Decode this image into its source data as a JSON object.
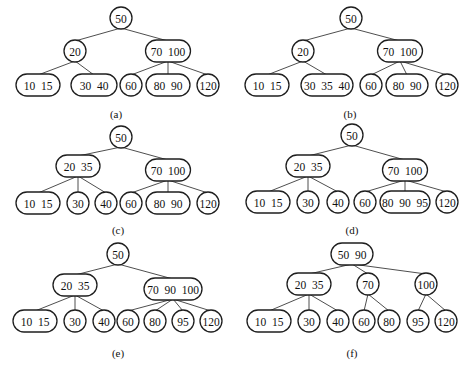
{
  "figure": {
    "panels": [
      {
        "id": "a",
        "caption": "(a)",
        "caption_pos": [
          116,
          114
        ],
        "nodes": [
          {
            "id": "root",
            "label": "50",
            "x": 121,
            "y": 18,
            "w": 22
          },
          {
            "id": "n20",
            "label": "20",
            "x": 75,
            "y": 51,
            "w": 22
          },
          {
            "id": "n70_100",
            "label": "70  100",
            "x": 168,
            "y": 51,
            "w": 45
          },
          {
            "id": "n10_15",
            "label": "10  15",
            "x": 38,
            "y": 85,
            "w": 44
          },
          {
            "id": "n30_40",
            "label": "30  40",
            "x": 94,
            "y": 85,
            "w": 46
          },
          {
            "id": "n60",
            "label": "60",
            "x": 131,
            "y": 85,
            "w": 22
          },
          {
            "id": "n80_90",
            "label": "80  90",
            "x": 168,
            "y": 85,
            "w": 44
          },
          {
            "id": "n120",
            "label": "120",
            "x": 208,
            "y": 85,
            "w": 22
          }
        ],
        "edges": [
          [
            "root",
            "n20"
          ],
          [
            "root",
            "n70_100"
          ],
          [
            "n20",
            "n10_15"
          ],
          [
            "n20",
            "n30_40"
          ],
          [
            "n70_100",
            "n60"
          ],
          [
            "n70_100",
            "n80_90"
          ],
          [
            "n70_100",
            "n120"
          ]
        ]
      },
      {
        "id": "b",
        "caption": "(b)",
        "caption_pos": [
          350,
          114
        ],
        "nodes": [
          {
            "id": "root",
            "label": "50",
            "x": 351,
            "y": 18,
            "w": 22
          },
          {
            "id": "n20",
            "label": "20",
            "x": 303,
            "y": 51,
            "w": 22
          },
          {
            "id": "n70_100",
            "label": "70  100",
            "x": 400,
            "y": 51,
            "w": 45
          },
          {
            "id": "n10_15",
            "label": "10  15",
            "x": 267,
            "y": 85,
            "w": 44
          },
          {
            "id": "n30_35_40",
            "label": "30  35  40",
            "x": 327,
            "y": 85,
            "w": 52
          },
          {
            "id": "n60",
            "label": "60",
            "x": 371,
            "y": 85,
            "w": 22
          },
          {
            "id": "n80_90",
            "label": "80  90",
            "x": 407,
            "y": 85,
            "w": 42
          },
          {
            "id": "n120",
            "label": "120",
            "x": 447,
            "y": 85,
            "w": 22
          }
        ],
        "edges": [
          [
            "root",
            "n20"
          ],
          [
            "root",
            "n70_100"
          ],
          [
            "n20",
            "n10_15"
          ],
          [
            "n20",
            "n30_35_40"
          ],
          [
            "n70_100",
            "n60"
          ],
          [
            "n70_100",
            "n80_90"
          ],
          [
            "n70_100",
            "n120"
          ]
        ]
      },
      {
        "id": "c",
        "caption": "(c)",
        "caption_pos": [
          118,
          230
        ],
        "nodes": [
          {
            "id": "root",
            "label": "50",
            "x": 121,
            "y": 137,
            "w": 22
          },
          {
            "id": "n20_35",
            "label": "20  35",
            "x": 78,
            "y": 166,
            "w": 44
          },
          {
            "id": "n70_100",
            "label": "70  100",
            "x": 168,
            "y": 170,
            "w": 45
          },
          {
            "id": "n10_15",
            "label": "10  15",
            "x": 38,
            "y": 203,
            "w": 44
          },
          {
            "id": "n30",
            "label": "30",
            "x": 78,
            "y": 203,
            "w": 22
          },
          {
            "id": "n40",
            "label": "40",
            "x": 106,
            "y": 203,
            "w": 22
          },
          {
            "id": "n60",
            "label": "60",
            "x": 131,
            "y": 203,
            "w": 22
          },
          {
            "id": "n80_90",
            "label": "80  90",
            "x": 168,
            "y": 203,
            "w": 44
          },
          {
            "id": "n120",
            "label": "120",
            "x": 208,
            "y": 203,
            "w": 22
          }
        ],
        "edges": [
          [
            "root",
            "n20_35"
          ],
          [
            "root",
            "n70_100"
          ],
          [
            "n20_35",
            "n10_15"
          ],
          [
            "n20_35",
            "n30"
          ],
          [
            "n20_35",
            "n40"
          ],
          [
            "n70_100",
            "n60"
          ],
          [
            "n70_100",
            "n80_90"
          ],
          [
            "n70_100",
            "n120"
          ]
        ]
      },
      {
        "id": "d",
        "caption": "(d)",
        "caption_pos": [
          352,
          230
        ],
        "nodes": [
          {
            "id": "root",
            "label": "50",
            "x": 352,
            "y": 135,
            "w": 22
          },
          {
            "id": "n20_35",
            "label": "20  35",
            "x": 308,
            "y": 166,
            "w": 44
          },
          {
            "id": "n70_100",
            "label": "70  100",
            "x": 405,
            "y": 170,
            "w": 45
          },
          {
            "id": "n10_15",
            "label": "10  15",
            "x": 268,
            "y": 202,
            "w": 44
          },
          {
            "id": "n30",
            "label": "30",
            "x": 308,
            "y": 202,
            "w": 22
          },
          {
            "id": "n40",
            "label": "40",
            "x": 338,
            "y": 202,
            "w": 22
          },
          {
            "id": "n60",
            "label": "60",
            "x": 365,
            "y": 202,
            "w": 22
          },
          {
            "id": "n80_90_95",
            "label": "80  90  95",
            "x": 405,
            "y": 202,
            "w": 50
          },
          {
            "id": "n120",
            "label": "120",
            "x": 447,
            "y": 202,
            "w": 22
          }
        ],
        "edges": [
          [
            "root",
            "n20_35"
          ],
          [
            "root",
            "n70_100"
          ],
          [
            "n20_35",
            "n10_15"
          ],
          [
            "n20_35",
            "n30"
          ],
          [
            "n20_35",
            "n40"
          ],
          [
            "n70_100",
            "n60"
          ],
          [
            "n70_100",
            "n80_90_95"
          ],
          [
            "n70_100",
            "n120"
          ]
        ]
      },
      {
        "id": "e",
        "caption": "(e)",
        "caption_pos": [
          118,
          353
        ],
        "nodes": [
          {
            "id": "root",
            "label": "50",
            "x": 118,
            "y": 254,
            "w": 22
          },
          {
            "id": "n20_35",
            "label": "20  35",
            "x": 75,
            "y": 285,
            "w": 44
          },
          {
            "id": "n70_90_100",
            "label": "70  90  100",
            "x": 173,
            "y": 289,
            "w": 58
          },
          {
            "id": "n10_15",
            "label": "10  15",
            "x": 35,
            "y": 321,
            "w": 44
          },
          {
            "id": "n30",
            "label": "30",
            "x": 75,
            "y": 321,
            "w": 22
          },
          {
            "id": "n40",
            "label": "40",
            "x": 104,
            "y": 321,
            "w": 22
          },
          {
            "id": "n60",
            "label": "60",
            "x": 128,
            "y": 321,
            "w": 22
          },
          {
            "id": "n80",
            "label": "80",
            "x": 155,
            "y": 321,
            "w": 22
          },
          {
            "id": "n95",
            "label": "95",
            "x": 183,
            "y": 321,
            "w": 22
          },
          {
            "id": "n120",
            "label": "120",
            "x": 211,
            "y": 321,
            "w": 22
          }
        ],
        "edges": [
          [
            "root",
            "n20_35"
          ],
          [
            "root",
            "n70_90_100"
          ],
          [
            "n20_35",
            "n10_15"
          ],
          [
            "n20_35",
            "n30"
          ],
          [
            "n20_35",
            "n40"
          ],
          [
            "n70_90_100",
            "n60"
          ],
          [
            "n70_90_100",
            "n80"
          ],
          [
            "n70_90_100",
            "n95"
          ],
          [
            "n70_90_100",
            "n120"
          ]
        ]
      },
      {
        "id": "f",
        "caption": "(f)",
        "caption_pos": [
          352,
          353
        ],
        "nodes": [
          {
            "id": "root",
            "label": "50  90",
            "x": 352,
            "y": 254,
            "w": 42
          },
          {
            "id": "n20_35",
            "label": "20  35",
            "x": 309,
            "y": 284,
            "w": 44
          },
          {
            "id": "n70",
            "label": "70",
            "x": 368,
            "y": 284,
            "w": 22
          },
          {
            "id": "n100",
            "label": "100",
            "x": 426,
            "y": 284,
            "w": 22
          },
          {
            "id": "n10_15",
            "label": "10  15",
            "x": 269,
            "y": 321,
            "w": 44
          },
          {
            "id": "n30",
            "label": "30",
            "x": 309,
            "y": 321,
            "w": 22
          },
          {
            "id": "n40",
            "label": "40",
            "x": 338,
            "y": 321,
            "w": 22
          },
          {
            "id": "n60",
            "label": "60",
            "x": 364,
            "y": 321,
            "w": 22
          },
          {
            "id": "n80",
            "label": "80",
            "x": 389,
            "y": 321,
            "w": 22
          },
          {
            "id": "n95",
            "label": "95",
            "x": 418,
            "y": 321,
            "w": 22
          },
          {
            "id": "n120",
            "label": "120",
            "x": 446,
            "y": 321,
            "w": 22
          }
        ],
        "edges": [
          [
            "root",
            "n20_35"
          ],
          [
            "root",
            "n70"
          ],
          [
            "root",
            "n100"
          ],
          [
            "n20_35",
            "n10_15"
          ],
          [
            "n20_35",
            "n30"
          ],
          [
            "n20_35",
            "n40"
          ],
          [
            "n70",
            "n60"
          ],
          [
            "n70",
            "n80"
          ],
          [
            "n100",
            "n95"
          ],
          [
            "n100",
            "n120"
          ]
        ]
      }
    ],
    "node_height": 22,
    "colors": {
      "stroke": "#1e1e1e",
      "edge": "#3a3a3a",
      "fill": "#ffffff",
      "text": "#111111"
    }
  }
}
